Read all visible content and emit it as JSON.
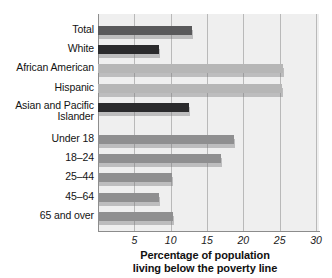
{
  "chart_data": {
    "type": "bar",
    "orientation": "horizontal",
    "title": "",
    "xlabel": "Percentage of population living below the poverty line",
    "xlabel_line1": "Percentage of population",
    "xlabel_line2": "living below the poverty line",
    "ylabel": "",
    "xlim": [
      0,
      30
    ],
    "xticks": [
      5,
      10,
      15,
      20,
      25,
      30
    ],
    "xtick_labels": [
      "5",
      "10",
      "15",
      "20",
      "25",
      "30"
    ],
    "grid": true,
    "legend": "none",
    "categories": [
      "Total",
      "White",
      "African American",
      "Hispanic",
      "Asian and Pacific Islander",
      "Under 18",
      "18–24",
      "25–44",
      "45–64",
      "65 and over"
    ],
    "values": [
      12.9,
      8.4,
      25.4,
      25.3,
      12.5,
      18.7,
      16.9,
      10.2,
      8.4,
      10.3
    ],
    "bars": [
      {
        "label_line1": "Total",
        "label_line2": "",
        "value": 12.9,
        "color": "#59595b",
        "tone": "dark"
      },
      {
        "label_line1": "White",
        "label_line2": "",
        "value": 8.4,
        "color": "#2b2b2d",
        "tone": "black"
      },
      {
        "label_line1": "African American",
        "label_line2": "",
        "value": 25.4,
        "color": "#b6b6b6",
        "tone": "light"
      },
      {
        "label_line1": "Hispanic",
        "label_line2": "",
        "value": 25.3,
        "color": "#b6b6b6",
        "tone": "light"
      },
      {
        "label_line1": "Asian and Pacific",
        "label_line2": "Islander",
        "value": 12.5,
        "color": "#2b2b2d",
        "tone": "black"
      },
      {
        "label_line1": "Under 18",
        "label_line2": "",
        "value": 18.7,
        "color": "#8f8f90",
        "tone": "mid"
      },
      {
        "label_line1": "18–24",
        "label_line2": "",
        "value": 16.9,
        "color": "#8f8f90",
        "tone": "mid"
      },
      {
        "label_line1": "25–44",
        "label_line2": "",
        "value": 10.2,
        "color": "#8f8f90",
        "tone": "mid"
      },
      {
        "label_line1": "45–64",
        "label_line2": "",
        "value": 8.4,
        "color": "#8f8f90",
        "tone": "mid"
      },
      {
        "label_line1": "65 and over",
        "label_line2": "",
        "value": 10.3,
        "color": "#8f8f90",
        "tone": "mid"
      }
    ],
    "colors": {
      "plot_background": "#efefef",
      "gridline": "#b9b9b9",
      "axis": "#8c8c8c",
      "text": "#131313"
    }
  }
}
